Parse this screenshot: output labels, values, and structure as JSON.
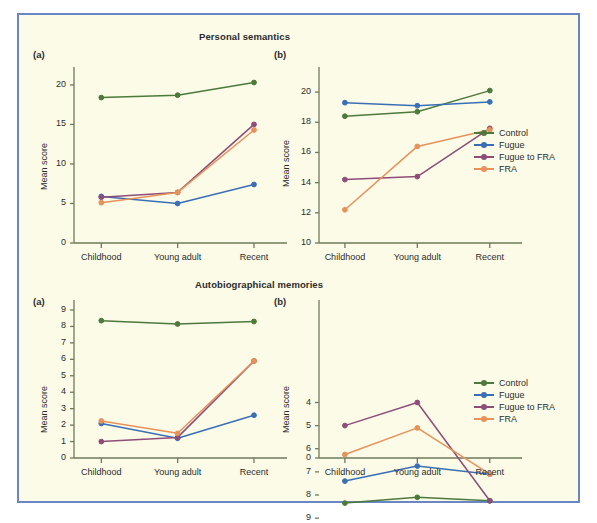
{
  "figure": {
    "background": "#fbfbe8",
    "border_color": "#6a86c4"
  },
  "series_colors": {
    "Control": "#4d7a3c",
    "Fugue": "#3a6fb5",
    "Fugue to FRA": "#8e4d78",
    "FRA": "#e8915a"
  },
  "legend": {
    "items": [
      {
        "label": "Control",
        "color": "#4d7a3c"
      },
      {
        "label": "Fugue",
        "color": "#3a6fb5"
      },
      {
        "label": "Fugue to FRA",
        "color": "#8e4d78"
      },
      {
        "label": "FRA",
        "color": "#e8915a"
      }
    ]
  },
  "panels": {
    "top_left_letter": "(a)",
    "top_right_letter": "(b)",
    "bottom_left_letter": "(a)",
    "bottom_right_letter": "(b)"
  },
  "axis_labels": {
    "y": "Mean score",
    "categories": [
      "Childhood",
      "Young adult",
      "Recent"
    ]
  },
  "chart_data": [
    {
      "id": "personal-semantics-a",
      "type": "line",
      "title": "Personal semantics",
      "panel": "(a)",
      "xlabel": "",
      "ylabel": "Mean score",
      "categories": [
        "Childhood",
        "Young adult",
        "Recent"
      ],
      "ylim": [
        0,
        21
      ],
      "yticks": [
        0,
        5,
        10,
        15,
        20
      ],
      "grid": false,
      "legend_position": "none",
      "series": [
        {
          "name": "Control",
          "color": "#4d7a3c",
          "values": [
            18.4,
            18.7,
            20.3
          ]
        },
        {
          "name": "Fugue",
          "color": "#3a6fb5",
          "values": [
            5.9,
            5.0,
            7.4
          ]
        },
        {
          "name": "Fugue to FRA",
          "color": "#8e4d78",
          "values": [
            5.8,
            6.4,
            15.0
          ]
        },
        {
          "name": "FRA",
          "color": "#e8915a",
          "values": [
            5.1,
            6.4,
            14.3
          ]
        }
      ]
    },
    {
      "id": "personal-semantics-b",
      "type": "line",
      "title": "Personal semantics",
      "panel": "(b)",
      "xlabel": "",
      "ylabel": "Mean score",
      "categories": [
        "Childhood",
        "Young adult",
        "Recent"
      ],
      "ylim": [
        10,
        21
      ],
      "yticks": [
        10,
        12,
        14,
        16,
        18,
        20
      ],
      "grid": false,
      "legend_position": "right",
      "series": [
        {
          "name": "Control",
          "color": "#4d7a3c",
          "values": [
            18.4,
            18.7,
            20.1
          ]
        },
        {
          "name": "Fugue",
          "color": "#3a6fb5",
          "values": [
            19.3,
            19.1,
            19.35
          ]
        },
        {
          "name": "Fugue to FRA",
          "color": "#8e4d78",
          "values": [
            14.2,
            14.4,
            17.6
          ]
        },
        {
          "name": "FRA",
          "color": "#e8915a",
          "values": [
            12.2,
            16.4,
            17.5
          ]
        }
      ]
    },
    {
      "id": "autobiographical-memories-a",
      "type": "line",
      "title": "Autobiographical memories",
      "panel": "(a)",
      "xlabel": "",
      "ylabel": "Mean score",
      "categories": [
        "Childhood",
        "Young adult",
        "Recent"
      ],
      "ylim": [
        0,
        9
      ],
      "yticks": [
        0,
        1,
        2,
        3,
        4,
        5,
        6,
        7,
        8,
        9
      ],
      "grid": false,
      "legend_position": "none",
      "series": [
        {
          "name": "Control",
          "color": "#4d7a3c",
          "values": [
            8.35,
            8.15,
            8.3
          ]
        },
        {
          "name": "Fugue",
          "color": "#3a6fb5",
          "values": [
            2.1,
            1.2,
            2.6
          ]
        },
        {
          "name": "Fugue to FRA",
          "color": "#8e4d78",
          "values": [
            1.0,
            1.25,
            5.9
          ]
        },
        {
          "name": "FRA",
          "color": "#e8915a",
          "values": [
            2.25,
            1.5,
            5.9
          ]
        }
      ]
    },
    {
      "id": "autobiographical-memories-b",
      "type": "line",
      "title": "Autobiographical memories",
      "panel": "(b)",
      "xlabel": "",
      "ylabel": "Mean score",
      "categories": [
        "Childhood",
        "Young adult",
        "Recent"
      ],
      "ylim": [
        0,
        9
      ],
      "yticks": [
        0,
        4,
        5,
        6,
        7,
        8,
        9
      ],
      "axis_break": true,
      "grid": false,
      "legend_position": "right",
      "series": [
        {
          "name": "Control",
          "color": "#4d7a3c",
          "values": [
            8.35,
            8.1,
            8.25
          ]
        },
        {
          "name": "Fugue",
          "color": "#3a6fb5",
          "values": [
            7.4,
            6.75,
            7.1
          ]
        },
        {
          "name": "Fugue to FRA",
          "color": "#8e4d78",
          "values": [
            5.0,
            4.0,
            8.25
          ]
        },
        {
          "name": "FRA",
          "color": "#e8915a",
          "values": [
            6.25,
            5.1,
            7.1
          ]
        }
      ]
    }
  ]
}
